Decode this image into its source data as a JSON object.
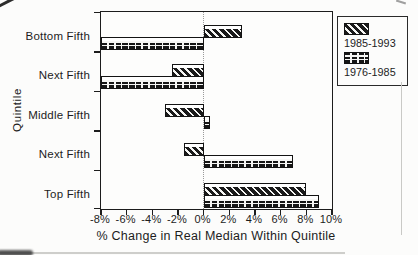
{
  "figure": {
    "kind": "scanned horizontal bar chart"
  },
  "chart_data": {
    "type": "bar",
    "orientation": "horizontal",
    "title": "",
    "xlabel": "% Change in Real Median Within Quintile",
    "ylabel": "Quintile",
    "categories": [
      "Bottom Fifth",
      "Next Fifth",
      "Middle Fifth",
      "Next Fifth",
      "Top Fifth"
    ],
    "series": [
      {
        "name": "1985-1993",
        "pattern": "diagonal-hatch",
        "values": [
          3,
          -2.5,
          -3,
          -1.5,
          8
        ]
      },
      {
        "name": "1976-1985",
        "pattern": "brick",
        "values": [
          -8,
          -8,
          0.5,
          7,
          9
        ]
      }
    ],
    "xlim": [
      -8,
      10
    ],
    "x_ticks": [
      -8,
      -6,
      -4,
      -2,
      0,
      2,
      4,
      6,
      8,
      10
    ],
    "x_tick_labels": [
      "-8%",
      "-6%",
      "-4%",
      "-2%",
      "0%",
      "2%",
      "4%",
      "6%",
      "8%",
      "10%"
    ],
    "zero_gridline": "dotted",
    "grid": "off",
    "legend_position": "outside-top-right"
  },
  "ink": {
    "line_color": "#1c1c1c",
    "zero_line_color": "#9a9a9a",
    "paper_color": "#fcfcfb"
  }
}
